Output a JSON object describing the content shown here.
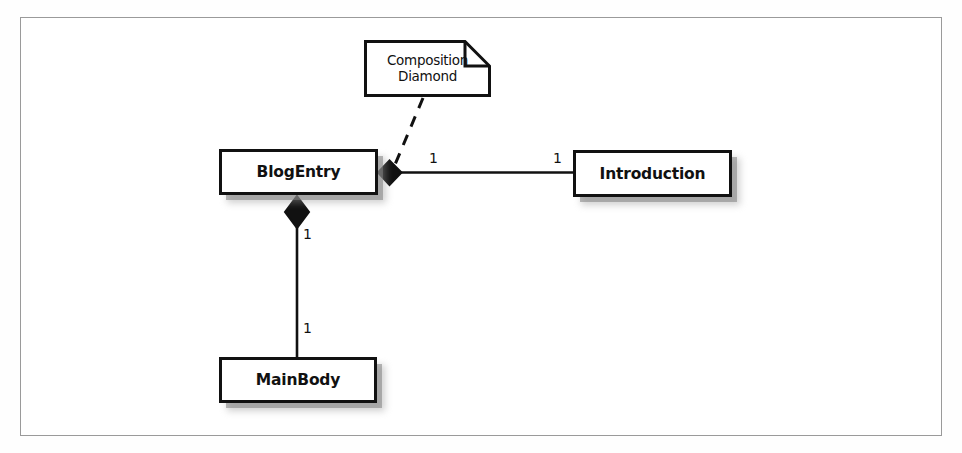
{
  "figure": {
    "caption": "",
    "frame": {
      "border_color": "#9a9a9a",
      "background": "#ffffff"
    }
  },
  "diagram": {
    "type": "uml-class-diagram",
    "line_color": "#111111",
    "fill_color": "#ffffff",
    "shadow_color": "#8a8a8a",
    "classes": [
      {
        "id": "blogentry",
        "name": "BlogEntry",
        "x": 219,
        "y": 149,
        "w": 159,
        "h": 46
      },
      {
        "id": "introduction",
        "name": "Introduction",
        "x": 573,
        "y": 150,
        "w": 159,
        "h": 47
      },
      {
        "id": "mainbody",
        "name": "MainBody",
        "x": 219,
        "y": 357,
        "w": 158,
        "h": 46
      }
    ],
    "note": {
      "id": "composition-diamond-note",
      "lines": [
        "Composition",
        "Diamond"
      ],
      "x": 364,
      "y": 40,
      "w": 127,
      "h": 57,
      "fold_size": 25,
      "anchor_style": "dashed"
    },
    "associations": [
      {
        "id": "blogentry-introduction",
        "from": "blogentry",
        "to": "introduction",
        "kind": "composition",
        "diamond_end": "blogentry",
        "orientation": "horizontal",
        "source_multiplicity": "1",
        "target_multiplicity": "1"
      },
      {
        "id": "blogentry-mainbody",
        "from": "blogentry",
        "to": "mainbody",
        "kind": "composition",
        "diamond_end": "blogentry",
        "orientation": "vertical",
        "source_multiplicity": "1",
        "target_multiplicity": "1"
      }
    ],
    "multiplicity_labels": [
      {
        "id": "mult-intro-left",
        "value": "1"
      },
      {
        "id": "mult-intro-right",
        "value": "1"
      },
      {
        "id": "mult-main-top",
        "value": "1"
      },
      {
        "id": "mult-main-bottom",
        "value": "1"
      }
    ]
  }
}
